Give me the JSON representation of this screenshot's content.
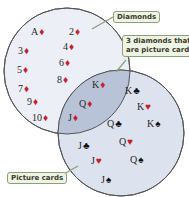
{
  "sets": {
    "diamonds": {
      "label": "Diamonds",
      "fill": "#eceff5",
      "stroke": "#555"
    },
    "picture_cards": {
      "label": "Picture cards",
      "fill": "#dde3ee",
      "stroke": "#555"
    },
    "intersection": {
      "label": "3 diamonds that are picture cards",
      "line1": "3 diamonds that",
      "line2": "are picture cards",
      "fill": "#b9c3d8"
    }
  },
  "cards": [
    {
      "rank": "A",
      "suit": "♦",
      "color": "red"
    },
    {
      "rank": "2",
      "suit": "♦",
      "color": "red"
    },
    {
      "rank": "3",
      "suit": "♦",
      "color": "red"
    },
    {
      "rank": "4",
      "suit": "♦",
      "color": "red"
    },
    {
      "rank": "5",
      "suit": "♦",
      "color": "red"
    },
    {
      "rank": "6",
      "suit": "♦",
      "color": "red"
    },
    {
      "rank": "7",
      "suit": "♦",
      "color": "red"
    },
    {
      "rank": "8",
      "suit": "♦",
      "color": "red"
    },
    {
      "rank": "9",
      "suit": "♦",
      "color": "red"
    },
    {
      "rank": "10",
      "suit": "♦",
      "color": "red"
    },
    {
      "rank": "K",
      "suit": "♦",
      "color": "red"
    },
    {
      "rank": "Q",
      "suit": "♦",
      "color": "red"
    },
    {
      "rank": "J",
      "suit": "♦",
      "color": "red"
    },
    {
      "rank": "K",
      "suit": "♣",
      "color": "black"
    },
    {
      "rank": "K",
      "suit": "♥",
      "color": "red"
    },
    {
      "rank": "Q",
      "suit": "♣",
      "color": "black"
    },
    {
      "rank": "K",
      "suit": "♠",
      "color": "black"
    },
    {
      "rank": "Q",
      "suit": "♥",
      "color": "red"
    },
    {
      "rank": "J",
      "suit": "♣",
      "color": "black"
    },
    {
      "rank": "Q",
      "suit": "♠",
      "color": "black"
    },
    {
      "rank": "J",
      "suit": "♥",
      "color": "red"
    },
    {
      "rank": "J",
      "suit": "♠",
      "color": "black"
    }
  ]
}
